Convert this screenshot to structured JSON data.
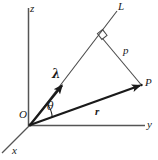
{
  "figure": {
    "kind": "vector-geometry-diagram",
    "background_color": "#ffffff",
    "ink_color": "#1a1a1a",
    "thin_line_color": "#555555",
    "labels": {
      "z_axis": "z",
      "y_axis": "y",
      "x_axis": "x",
      "origin": "O",
      "line": "L",
      "point": "P",
      "direction_vector": "λ",
      "position_vector": "r",
      "distance": "p",
      "angle": "θ"
    }
  },
  "geometry": {
    "origin": {
      "x": 30,
      "y": 125
    },
    "z_axis_top": {
      "x": 28,
      "y": 8
    },
    "y_axis_end": {
      "x": 145,
      "y": 125
    },
    "x_axis_end": {
      "x": 2,
      "y": 153
    },
    "line_L_end": {
      "x": 117,
      "y": 11
    },
    "lambda_arrow_tip": {
      "x": 63,
      "y": 84
    },
    "point_P": {
      "x": 142,
      "y": 85
    },
    "foot_of_perpendicular": {
      "x": 103,
      "y": 38
    },
    "theta_arc_radius": 22
  },
  "label_positions": {
    "z": {
      "left": 30,
      "top": 3
    },
    "L": {
      "left": 118,
      "top": 1
    },
    "p": {
      "left": 123,
      "top": 45
    },
    "P": {
      "left": 145,
      "top": 77
    },
    "lambda": {
      "left": 52,
      "top": 68
    },
    "theta": {
      "left": 47,
      "top": 101
    },
    "r": {
      "left": 95,
      "top": 106
    },
    "O": {
      "left": 19,
      "top": 109
    },
    "y": {
      "left": 147,
      "top": 119
    },
    "x": {
      "left": 12,
      "top": 145
    }
  }
}
